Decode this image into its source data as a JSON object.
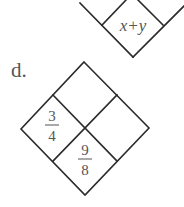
{
  "problems": [
    {
      "label": "",
      "top_diamond_partial": true,
      "bottom_cell": "x+y"
    },
    {
      "label": "d.",
      "cells": {
        "top": "",
        "left_numerator": "3",
        "left_denominator": "4",
        "right": "",
        "bottom_numerator": "9",
        "bottom_denominator": "8"
      }
    }
  ]
}
